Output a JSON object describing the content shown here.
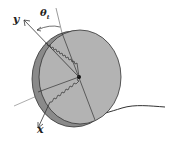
{
  "diagram": {
    "type": "rolling-disk-on-curved-surface",
    "labels": {
      "y_axis": "y",
      "x_axis": "x",
      "angle": "θ",
      "angle_subscript": "t"
    },
    "colors": {
      "disk_face": "#b3b3b3",
      "disk_rim": "#8a8a8a",
      "outline": "#333333",
      "background": "#ffffff"
    }
  }
}
